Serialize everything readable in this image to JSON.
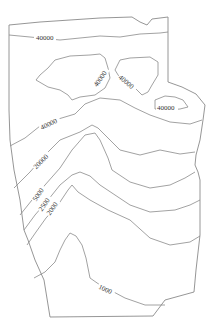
{
  "map": {
    "type": "contour-map",
    "line_color": "#8a8a8a",
    "label_color": "#333333",
    "contour_labels": [
      {
        "id": "top-band",
        "text": "40000"
      },
      {
        "id": "left-island",
        "text": "40000"
      },
      {
        "id": "mid-island",
        "text": "40000"
      },
      {
        "id": "right-island",
        "text": "40000"
      },
      {
        "id": "upper-curve",
        "text": "40000"
      },
      {
        "id": "curve-20000",
        "text": "20000"
      },
      {
        "id": "curve-5000",
        "text": "5000"
      },
      {
        "id": "curve-2500",
        "text": "2500"
      },
      {
        "id": "curve-2000",
        "text": "2000"
      },
      {
        "id": "curve-1000",
        "text": "1000"
      }
    ]
  }
}
